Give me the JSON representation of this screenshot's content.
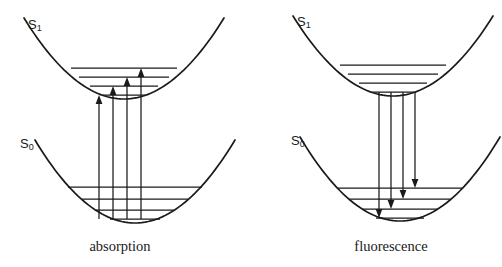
{
  "figure": {
    "type": "energy-level-diagram",
    "background_color": "#ffffff",
    "line_color": "#1a1a1a"
  },
  "panels": [
    {
      "id": "absorption",
      "caption": "absorption",
      "caption_x": 120,
      "caption_y": 238,
      "states": [
        {
          "name": "S1",
          "label_text": "S",
          "label_sub": "1",
          "label_x": 28,
          "label_y": 17,
          "well": {
            "vertex_x": 124,
            "vertex_y": 99,
            "half_width": 100,
            "top_y": 18,
            "curvature": 0.0081
          },
          "vibrational_levels": [
            {
              "v": 3,
              "y": 68,
              "x1": 71,
              "x2": 177
            },
            {
              "v": 2,
              "y": 77,
              "x1": 79,
              "x2": 169
            },
            {
              "v": 1,
              "y": 86,
              "x1": 90,
              "x2": 158
            },
            {
              "v": 0,
              "y": 95,
              "x1": 103,
              "x2": 145
            }
          ]
        },
        {
          "name": "S0",
          "label_text": "S",
          "label_sub": "0",
          "label_x": 20,
          "label_y": 136,
          "well": {
            "vertex_x": 135,
            "vertex_y": 223,
            "half_width": 100,
            "top_y": 140,
            "curvature": 0.0081
          },
          "vibrational_levels": [
            {
              "v": 3,
              "y": 187,
              "x1": 68,
              "x2": 202
            },
            {
              "v": 2,
              "y": 199,
              "x1": 82,
              "x2": 188
            },
            {
              "v": 1,
              "y": 210,
              "x1": 96,
              "x2": 174
            },
            {
              "v": 0,
              "y": 219,
              "x1": 110,
              "x2": 160
            }
          ]
        }
      ],
      "transitions": [
        {
          "id": "abs-0-0",
          "direction": "up",
          "x": 99,
          "y_start": 219,
          "y_end": 95
        },
        {
          "id": "abs-0-1",
          "direction": "up",
          "x": 113,
          "y_start": 219,
          "y_end": 86
        },
        {
          "id": "abs-0-2",
          "direction": "up",
          "x": 127,
          "y_start": 219,
          "y_end": 77
        },
        {
          "id": "abs-0-3",
          "direction": "up",
          "x": 141,
          "y_start": 219,
          "y_end": 68
        }
      ]
    },
    {
      "id": "fluorescence",
      "caption": "fluorescence",
      "caption_x": 391,
      "caption_y": 238,
      "states": [
        {
          "name": "S1",
          "label_text": "S",
          "label_sub": "1",
          "label_x": 297,
          "label_y": 14,
          "well": {
            "vertex_x": 393,
            "vertex_y": 96,
            "half_width": 100,
            "top_y": 16,
            "curvature": 0.0081
          },
          "vibrational_levels": [
            {
              "v": 3,
              "y": 65,
              "x1": 340,
              "x2": 446
            },
            {
              "v": 2,
              "y": 74,
              "x1": 348,
              "x2": 438
            },
            {
              "v": 1,
              "y": 83,
              "x1": 359,
              "x2": 427
            },
            {
              "v": 0,
              "y": 92,
              "x1": 372,
              "x2": 414
            }
          ]
        },
        {
          "name": "S0",
          "label_text": "S",
          "label_sub": "0",
          "label_x": 291,
          "label_y": 133,
          "well": {
            "vertex_x": 400,
            "vertex_y": 221,
            "half_width": 100,
            "top_y": 137,
            "curvature": 0.0081
          },
          "vibrational_levels": [
            {
              "v": 3,
              "y": 188,
              "x1": 337,
              "x2": 463
            },
            {
              "v": 2,
              "y": 199,
              "x1": 350,
              "x2": 450
            },
            {
              "v": 1,
              "y": 209,
              "x1": 363,
              "x2": 437
            },
            {
              "v": 0,
              "y": 218,
              "x1": 376,
              "x2": 424
            }
          ]
        }
      ],
      "transitions": [
        {
          "id": "fluo-0-0",
          "direction": "down",
          "x": 379,
          "y_start": 92,
          "y_end": 218
        },
        {
          "id": "fluo-0-1",
          "direction": "down",
          "x": 391,
          "y_start": 92,
          "y_end": 209
        },
        {
          "id": "fluo-0-2",
          "direction": "down",
          "x": 403,
          "y_start": 92,
          "y_end": 199
        },
        {
          "id": "fluo-0-3",
          "direction": "down",
          "x": 415,
          "y_start": 92,
          "y_end": 188
        }
      ]
    }
  ]
}
